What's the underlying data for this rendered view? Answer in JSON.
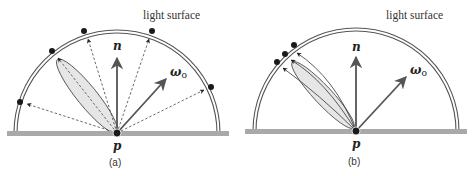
{
  "figure": {
    "panels": [
      {
        "id": "a",
        "caption": "(a)",
        "surface_label": "light surface",
        "point_label": "p",
        "normal_label": "n",
        "outgoing_label": "ω",
        "outgoing_subscript": "o",
        "description": "Uniform hemisphere sampling: dashed rays from p to sample points spread over the light surface; a glossy BRDF lobe points toward upper-left."
      },
      {
        "id": "b",
        "caption": "(b)",
        "surface_label": "light surface",
        "point_label": "p",
        "normal_label": "n",
        "outgoing_label": "ω",
        "outgoing_subscript": "o",
        "description": "BRDF importance sampling: solid rays concentrated inside the glossy lobe, hitting three clustered sample points on the light surface."
      }
    ],
    "colors": {
      "ground": "#a9a9a9",
      "arc": "#555555",
      "lobe_fill": "#e6e6e6",
      "lobe_stroke": "#555555",
      "arrow": "#5a5a5a",
      "dot": "#1a1a1a",
      "dashed_ray": "#444444"
    }
  }
}
